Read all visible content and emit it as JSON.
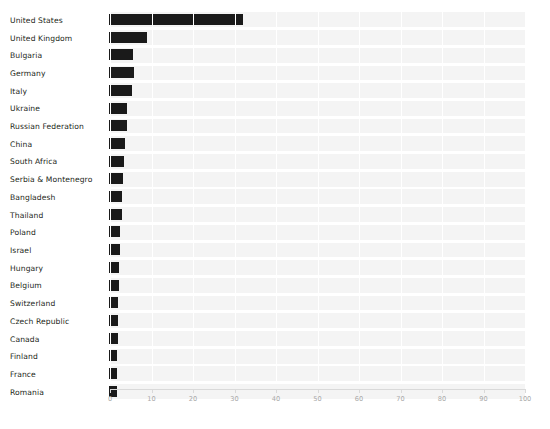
{
  "title": "",
  "chart_data": {
    "type": "bar",
    "orientation": "horizontal",
    "title": "",
    "xlabel": "",
    "ylabel": "",
    "xlim": [
      0,
      100
    ],
    "xticks": [
      0,
      10,
      20,
      30,
      40,
      50,
      60,
      70,
      80,
      90,
      100
    ],
    "xtick_labels": [
      "0",
      "10",
      "20",
      "30",
      "40",
      "50",
      "60",
      "70",
      "80",
      "90",
      "100"
    ],
    "grid": true,
    "legend": false,
    "bar_color": "#1a1a1a",
    "band_color": "#f4f4f4",
    "gridline_color": "#ffffff",
    "axis_color": "#d9d9d9",
    "tick_label_color": "#a8a8a8",
    "categories": [
      "United States",
      "United Kingdom",
      "Bulgaria",
      "Germany",
      "Italy",
      "Ukraine",
      "Russian Federation",
      "China",
      "South Africa",
      "Serbia & Montenegro",
      "Bangladesh",
      "Thailand",
      "Poland",
      "Israel",
      "Hungary",
      "Belgium",
      "Switzerland",
      "Czech Republic",
      "Canada",
      "Finland",
      "France",
      "Romania"
    ],
    "values": [
      32.0,
      9.0,
      5.5,
      5.8,
      5.3,
      4.2,
      4.1,
      3.7,
      3.4,
      3.2,
      3.0,
      2.9,
      2.3,
      2.3,
      2.2,
      2.1,
      2.0,
      2.0,
      1.9,
      1.8,
      1.8,
      1.7
    ]
  }
}
